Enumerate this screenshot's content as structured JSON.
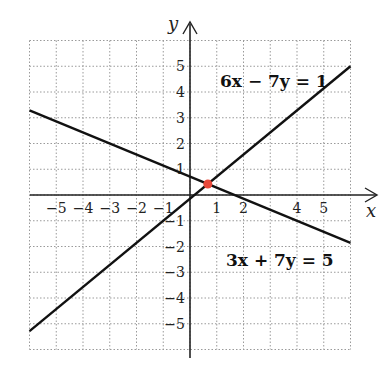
{
  "chart_data": {
    "type": "line",
    "title": "",
    "xlabel": "x",
    "ylabel": "y",
    "xlim": [
      -6,
      6
    ],
    "ylim": [
      -6,
      6
    ],
    "grid": true,
    "x_tick_labels": [
      "−5",
      "−4",
      "−3",
      "−2",
      "−1",
      "1",
      "2",
      "4",
      "5"
    ],
    "x_tick_values": [
      -5,
      -4,
      -3,
      -2,
      -1,
      1,
      2,
      4,
      5
    ],
    "y_tick_labels": [
      "5",
      "4",
      "3",
      "2",
      "1",
      "−1",
      "−2",
      "−3",
      "−4",
      "−5"
    ],
    "y_tick_values": [
      5,
      4,
      3,
      2,
      1,
      -1,
      -2,
      -3,
      -4,
      -5
    ],
    "series": [
      {
        "name": "6x − 7y = 1",
        "x": [
          -6,
          6
        ],
        "y": [
          -5.286,
          5.0
        ]
      },
      {
        "name": "3x + 7y = 5",
        "x": [
          -6,
          6
        ],
        "y": [
          3.286,
          -1.857
        ]
      }
    ],
    "annotations": [
      {
        "text": "6x − 7y = 1",
        "position": "upper right"
      },
      {
        "text": "3x + 7y = 5",
        "position": "lower right"
      }
    ],
    "points": [
      {
        "label": "intersection",
        "x": 0.667,
        "y": 0.429,
        "color": "#e8483a"
      }
    ]
  },
  "labels": {
    "x_axis": "x",
    "y_axis": "y",
    "eq1": "6x − 7y = 1",
    "eq2": "3x + 7y = 5"
  },
  "colors": {
    "line": "#111111",
    "grid": "#9a9a9a",
    "point": "#e8483a"
  }
}
